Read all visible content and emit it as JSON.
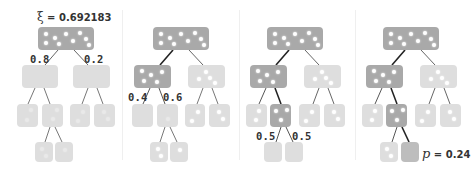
{
  "figure": {
    "xi_label": {
      "symbol": "ξ",
      "eq": " = ",
      "value": "0.692183"
    },
    "p_label": {
      "symbol": "p",
      "eq": " = ",
      "value": "0.24"
    },
    "colors": {
      "selected": "#a9a9a9",
      "unselected": "#dedede",
      "edge_selected": "#222222",
      "edge": "#555555",
      "star": "#ffffff"
    },
    "panels": [
      {
        "step": 1,
        "labels": [
          {
            "text": "0.8"
          },
          {
            "text": "0.2"
          }
        ]
      },
      {
        "step": 2,
        "labels": [
          {
            "text": "0.4"
          },
          {
            "text": "0.6"
          }
        ]
      },
      {
        "step": 3,
        "labels": [
          {
            "text": "0.5"
          },
          {
            "text": "0.5"
          }
        ]
      },
      {
        "step": 4,
        "labels": []
      }
    ]
  }
}
